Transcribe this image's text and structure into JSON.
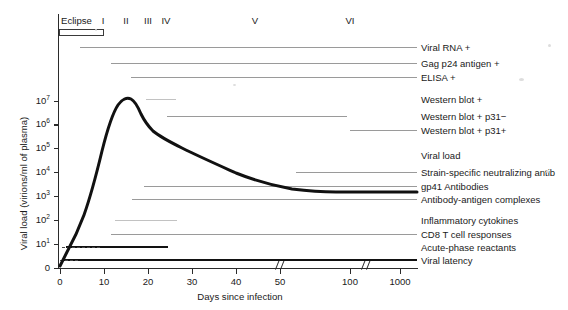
{
  "chart_data": {
    "type": "line",
    "title": "",
    "xlabel": "Days since infection",
    "ylabel": "Viral load (virions/ml of plasma)",
    "y_scale": "log",
    "ylim": [
      0,
      10000000
    ],
    "ytick_labels": [
      "0",
      "10",
      "10",
      "10",
      "10",
      "10",
      "10",
      "10"
    ],
    "ytick_exponents": [
      "",
      "1",
      "2",
      "3",
      "4",
      "5",
      "6",
      "7"
    ],
    "ytick_values": [
      0,
      10,
      100,
      1000,
      10000,
      100000,
      1000000,
      10000000
    ],
    "xtick_labels": [
      "0",
      "10",
      "20",
      "30",
      "40",
      "50",
      "100",
      "1000"
    ],
    "xtick_values": [
      0,
      10,
      20,
      30,
      40,
      50,
      100,
      1000
    ],
    "x_axis_breaks": [
      {
        "after": 50,
        "before": 100
      },
      {
        "after": 100,
        "before": 1000
      }
    ],
    "grid": false,
    "legend": "right-side row labels",
    "series": [
      {
        "name": "Viral load",
        "points": [
          {
            "day": 0,
            "value": 1
          },
          {
            "day": 5,
            "value": 10
          },
          {
            "day": 10,
            "value": 300
          },
          {
            "day": 14,
            "value": 100000
          },
          {
            "day": 17,
            "value": 3000000
          },
          {
            "day": 21,
            "value": 12000000
          },
          {
            "day": 25,
            "value": 4000000
          },
          {
            "day": 30,
            "value": 1500000
          },
          {
            "day": 40,
            "value": 600000
          },
          {
            "day": 50,
            "value": 250000
          },
          {
            "day": 80,
            "value": 80000
          },
          {
            "day": 100,
            "value": 45000
          },
          {
            "day": 300,
            "value": 32000
          },
          {
            "day": 1000,
            "value": 32000
          }
        ]
      }
    ],
    "annotations": {
      "peak_value": 12000000,
      "peak_day": 21,
      "setpoint_value": 32000
    }
  },
  "phases": [
    {
      "label": "Eclipse",
      "name": "phase-eclipse"
    },
    {
      "label": "I",
      "name": "phase-1"
    },
    {
      "label": "II",
      "name": "phase-2"
    },
    {
      "label": "III",
      "name": "phase-3"
    },
    {
      "label": "IV",
      "name": "phase-4"
    },
    {
      "label": "V",
      "name": "phase-5"
    },
    {
      "label": "VI",
      "name": "phase-6"
    }
  ],
  "rows": [
    {
      "label": "Viral RNA +",
      "name": "row-viral-rna"
    },
    {
      "label": "Gag p24 antigen +",
      "name": "row-gag-p24-antigen"
    },
    {
      "label": "ELISA +",
      "name": "row-elisa"
    },
    {
      "label": "Western blot +",
      "name": "row-western-blot"
    },
    {
      "label": "Western blot + p31−",
      "name": "row-western-blot-p31-neg"
    },
    {
      "label": "Western blot + p31+",
      "name": "row-western-blot-p31-pos"
    },
    {
      "label": "Viral load",
      "name": "row-viral-load"
    },
    {
      "label": "Strain-specific neutralizing antib",
      "name": "row-strain-specific-neutralizing-antibodies"
    },
    {
      "label": "gp41 Antibodies",
      "name": "row-gp41-antibodies"
    },
    {
      "label": "Antibody-antigen complexes",
      "name": "row-antibody-antigen-complexes"
    },
    {
      "label": "Inflammatory cytokines",
      "name": "row-inflammatory-cytokines"
    },
    {
      "label": "CD8 T cell responses",
      "name": "row-cd8-t-cell-responses"
    },
    {
      "label": "Acute-phase reactants",
      "name": "row-acute-phase-reactants"
    },
    {
      "label": "Viral latency",
      "name": "row-viral-latency"
    }
  ],
  "colors": {
    "axis": "#2b2b2b",
    "curve": "#111111",
    "marker": "#9a9a9a",
    "marker_bold": "#121212",
    "text": "#1a1a1a"
  }
}
